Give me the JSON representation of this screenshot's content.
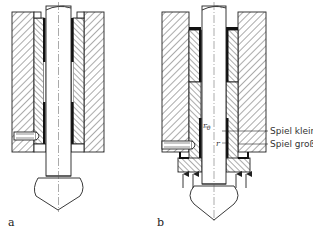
{
  "figure": {
    "type": "technical cross-section drawing",
    "panels": [
      {
        "id": "a",
        "label": "a"
      },
      {
        "id": "b",
        "label": "b"
      }
    ],
    "annotations": {
      "r0": "r",
      "r0_sub": "0",
      "r": "r",
      "spiel_klein": "Spiel klein",
      "spiel_gross": "Spiel groß"
    },
    "colors": {
      "ink": "#222222",
      "background": "#ffffff"
    }
  }
}
